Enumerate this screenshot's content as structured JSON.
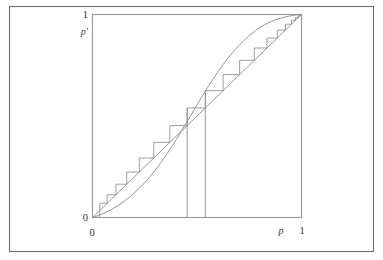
{
  "figure": {
    "kind": "cobweb-diagram",
    "background_color": "#ffffff",
    "outer_border_color": "#6e6e6e",
    "plot_border_color": "#9a9a9a",
    "curve_color": "#8a8a8a"
  },
  "labels": {
    "y_axis_symbol": "p′",
    "y_axis_max": "1",
    "y_axis_min": "0",
    "x_axis_symbol": "p",
    "x_axis_max": "1",
    "x_axis_min": "0"
  },
  "chart_data": {
    "type": "line",
    "title": "",
    "xlabel": "p",
    "ylabel": "p′",
    "xlim": [
      0,
      1
    ],
    "ylim": [
      0,
      1
    ],
    "xticks": [
      0,
      1
    ],
    "yticks": [
      0,
      1
    ],
    "xticklabels": [
      "0",
      "1"
    ],
    "yticklabels": [
      "0",
      "1"
    ],
    "grid": false,
    "legend": "none",
    "series": [
      {
        "name": "map p' = f(p)",
        "kind": "curve",
        "x": [
          0.0,
          0.05,
          0.1,
          0.15,
          0.2,
          0.25,
          0.3,
          0.35,
          0.4,
          0.45,
          0.5,
          0.55,
          0.6,
          0.65,
          0.7,
          0.75,
          0.8,
          0.85,
          0.9,
          0.95,
          1.0
        ],
        "y": [
          0.0,
          0.019,
          0.045,
          0.079,
          0.121,
          0.172,
          0.233,
          0.304,
          0.383,
          0.468,
          0.555,
          0.639,
          0.717,
          0.787,
          0.847,
          0.896,
          0.935,
          0.963,
          0.982,
          0.994,
          1.0
        ]
      },
      {
        "name": "identity line p' = p",
        "kind": "diagonal",
        "x": [
          0.0,
          1.0
        ],
        "y": [
          0.0,
          1.0
        ]
      },
      {
        "name": "cobweb staircase",
        "kind": "staircase",
        "start_p": 0.035,
        "vertices_p": [
          0.035,
          0.035,
          0.07,
          0.07,
          0.112,
          0.112,
          0.164,
          0.164,
          0.224,
          0.224,
          0.293,
          0.293,
          0.37,
          0.37,
          0.453,
          0.453,
          0.54,
          0.54,
          0.625,
          0.625,
          0.704,
          0.704,
          0.774,
          0.774,
          0.835,
          0.835,
          0.884,
          0.884,
          0.923,
          0.923,
          0.952,
          0.952,
          0.972,
          0.972,
          0.985,
          0.985,
          0.993,
          0.993,
          1.0,
          1.0
        ],
        "vertices_pprime": [
          0.0,
          0.07,
          0.07,
          0.112,
          0.112,
          0.164,
          0.164,
          0.224,
          0.224,
          0.293,
          0.293,
          0.37,
          0.37,
          0.453,
          0.453,
          0.54,
          0.54,
          0.625,
          0.625,
          0.704,
          0.704,
          0.774,
          0.774,
          0.835,
          0.835,
          0.884,
          0.884,
          0.923,
          0.923,
          0.952,
          0.952,
          0.972,
          0.972,
          0.985,
          0.985,
          0.993,
          0.993,
          1.0,
          1.0,
          1.0
        ],
        "note": "alternating vertical-to-curve then horizontal-to-diagonal segments"
      },
      {
        "name": "drop lines",
        "kind": "vertical-drop",
        "x": [
          0.453,
          0.54
        ],
        "y_top": [
          0.54,
          0.625
        ],
        "y_bottom": [
          0.0,
          0.0
        ]
      }
    ]
  }
}
